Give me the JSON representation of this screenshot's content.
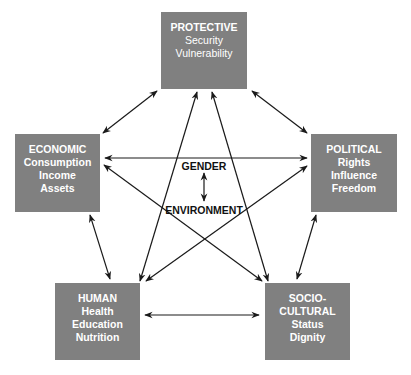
{
  "diagram": {
    "colors": {
      "box": "#808080",
      "box_text": "#ffffff",
      "line": "#1a1a1a"
    },
    "nodes": {
      "protective": {
        "title": "PROTECTIVE",
        "items": [
          "Security",
          "Vulnerability"
        ]
      },
      "economic": {
        "title": "ECONOMIC",
        "items": [
          "Consumption",
          "Income",
          "Assets"
        ]
      },
      "political": {
        "title": "POLITICAL",
        "items": [
          "Rights",
          "Influence",
          "Freedom"
        ]
      },
      "human": {
        "title": "HUMAN",
        "items": [
          "Health",
          "Education",
          "Nutrition"
        ]
      },
      "socio_cultural": {
        "title": "SOCIO-",
        "title2": "CULTURAL",
        "items": [
          "Status",
          "Dignity"
        ]
      }
    },
    "center": {
      "top": "GENDER",
      "bottom": "ENVIRONMENT"
    },
    "links": [
      {
        "from": "protective",
        "to": "economic",
        "bidirectional": true
      },
      {
        "from": "protective",
        "to": "political",
        "bidirectional": true
      },
      {
        "from": "protective",
        "to": "human",
        "bidirectional": true
      },
      {
        "from": "protective",
        "to": "socio_cultural",
        "bidirectional": true
      },
      {
        "from": "economic",
        "to": "political",
        "bidirectional": true
      },
      {
        "from": "economic",
        "to": "socio_cultural",
        "bidirectional": true
      },
      {
        "from": "political",
        "to": "human",
        "bidirectional": true
      },
      {
        "from": "economic",
        "to": "human",
        "bidirectional": true
      },
      {
        "from": "political",
        "to": "socio_cultural",
        "bidirectional": true
      },
      {
        "from": "human",
        "to": "socio_cultural",
        "bidirectional": true
      },
      {
        "from": "gender",
        "to": "environment",
        "bidirectional": true
      }
    ]
  }
}
